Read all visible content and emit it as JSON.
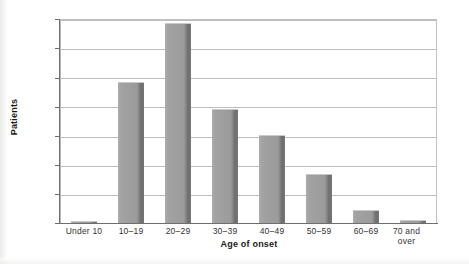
{
  "chart_data": {
    "type": "bar",
    "title": "",
    "xlabel": "Age of onset",
    "ylabel": "Patients",
    "categories": [
      "Under 10",
      "10–19",
      "20–29",
      "30–39",
      "40–49",
      "50–59",
      "60–69",
      "70 and over"
    ],
    "values": [
      5,
      291,
      412,
      235,
      182,
      100,
      27,
      7
    ],
    "ylim": [
      0,
      420
    ],
    "yticks": [
      0,
      60,
      120,
      180,
      240,
      300,
      360,
      420
    ],
    "ytick_labels": [
      "0",
      "60",
      "120",
      "180",
      "240",
      "300",
      "360",
      "420"
    ],
    "grid": true,
    "legend": "none",
    "bar_color": "#9b9b9b",
    "bar_edge_color": "#6e6e6e",
    "axis_color": "#6e6e6e",
    "gridline_color": "#bdbdbd",
    "background_color": "#ffffff",
    "text_color": "#333333"
  }
}
